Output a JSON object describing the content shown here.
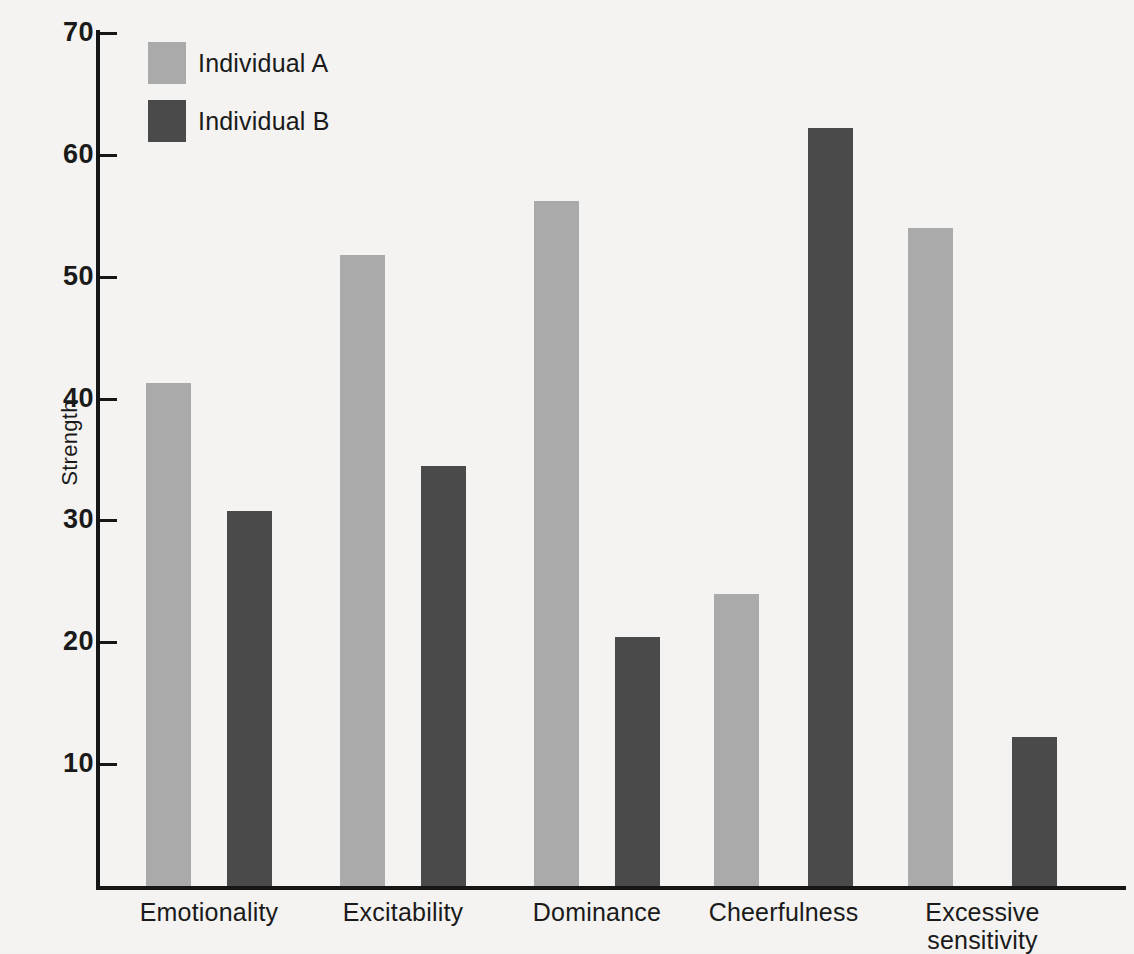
{
  "chart_data": {
    "type": "bar",
    "title": "",
    "xlabel": "",
    "ylabel": "Strength",
    "ylim": [
      0,
      70
    ],
    "yticks": [
      10,
      20,
      30,
      40,
      50,
      60,
      70
    ],
    "grid": false,
    "legend_position": "top-left",
    "categories": [
      "Emotionality",
      "Excitability",
      "Dominance",
      "Cheerfulness",
      "Excessive sensitivity"
    ],
    "series": [
      {
        "name": "Individual A",
        "color": "#aaaaaa",
        "values": [
          41.3,
          51.8,
          56.2,
          24.0,
          54.0
        ]
      },
      {
        "name": "Individual B",
        "color": "#4a4a4a",
        "values": [
          30.8,
          34.5,
          20.4,
          62.2,
          12.2
        ]
      }
    ]
  },
  "axis": {
    "y_title": "Strength",
    "y_tick_labels": [
      "70",
      "60",
      "50",
      "40",
      "30",
      "20",
      "10"
    ]
  },
  "legend": {
    "items": [
      {
        "label": "Individual A"
      },
      {
        "label": "Individual B"
      }
    ]
  },
  "categories_display": [
    {
      "line1": "Emotionality",
      "line2": ""
    },
    {
      "line1": "Excitability",
      "line2": ""
    },
    {
      "line1": "Dominance",
      "line2": ""
    },
    {
      "line1": "Cheerfulness",
      "line2": ""
    },
    {
      "line1": "Excessive",
      "line2": "sensitivity"
    }
  ]
}
